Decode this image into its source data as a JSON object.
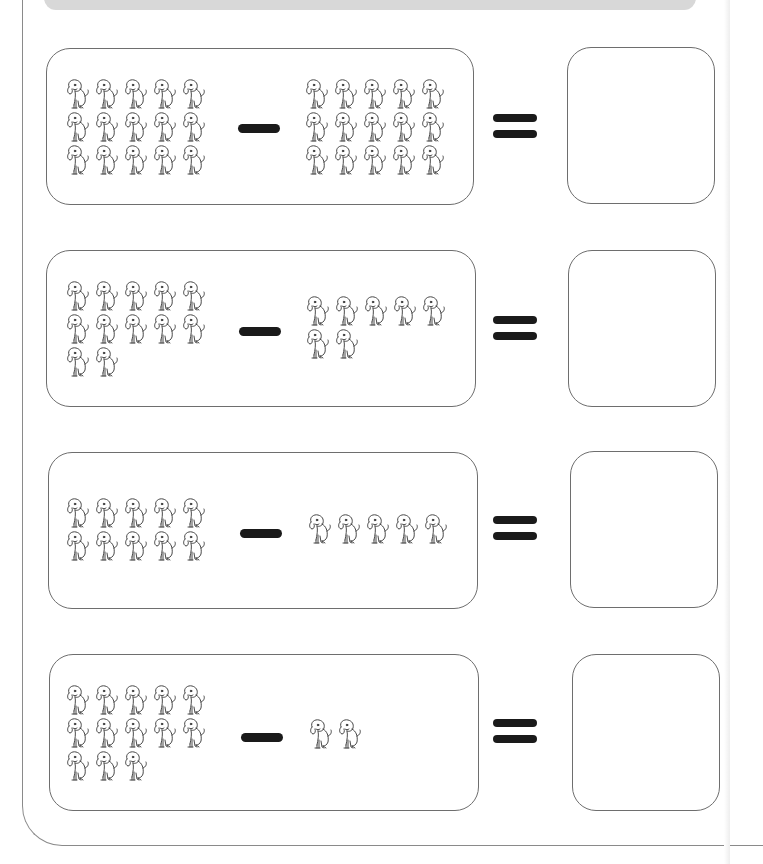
{
  "worksheet": {
    "title": "",
    "icons": {
      "counter": "dog-icon",
      "operator": "minus-sign",
      "result": "equals-sign"
    },
    "colors": {
      "border": "#6e6e6e",
      "symbol": "#1a1a1a",
      "top_bar": "#d8d8d8"
    },
    "problems": [
      {
        "minuend_count": 15,
        "subtrahend_count": 15,
        "answer": ""
      },
      {
        "minuend_count": 12,
        "subtrahend_count": 7,
        "answer": ""
      },
      {
        "minuend_count": 10,
        "subtrahend_count": 5,
        "answer": ""
      },
      {
        "minuend_count": 13,
        "subtrahend_count": 2,
        "answer": ""
      }
    ]
  }
}
